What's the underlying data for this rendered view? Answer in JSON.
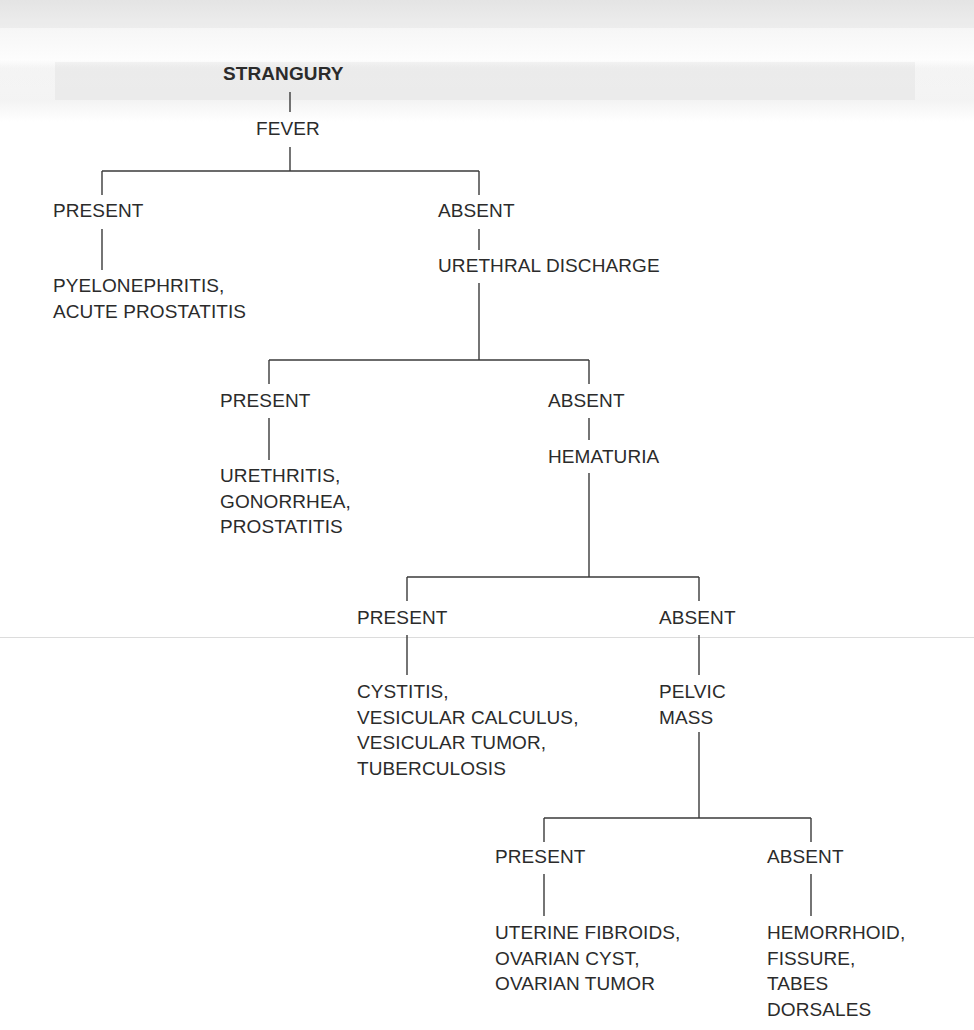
{
  "diagram": {
    "type": "decision-tree",
    "title": "STRANGURY",
    "root": {
      "label": "STRANGURY",
      "question": "FEVER",
      "branches": [
        {
          "label": "PRESENT",
          "result_lines": [
            "PYELONEPHRITIS,",
            "ACUTE PROSTATITIS"
          ]
        },
        {
          "label": "ABSENT",
          "question": "URETHRAL DISCHARGE",
          "branches": [
            {
              "label": "PRESENT",
              "result_lines": [
                "URETHRITIS,",
                "GONORRHEA,",
                "PROSTATITIS"
              ]
            },
            {
              "label": "ABSENT",
              "question": "HEMATURIA",
              "branches": [
                {
                  "label": "PRESENT",
                  "result_lines": [
                    "CYSTITIS,",
                    "VESICULAR CALCULUS,",
                    "VESICULAR TUMOR,",
                    "TUBERCULOSIS"
                  ]
                },
                {
                  "label": "ABSENT",
                  "question_lines": [
                    "PELVIC",
                    "MASS"
                  ],
                  "branches": [
                    {
                      "label": "PRESENT",
                      "result_lines": [
                        "UTERINE FIBROIDS,",
                        "OVARIAN CYST,",
                        "OVARIAN TUMOR"
                      ]
                    },
                    {
                      "label": "ABSENT",
                      "result_lines": [
                        "HEMORRHOID,",
                        "FISSURE,",
                        "TABES",
                        "DORSALES"
                      ]
                    }
                  ]
                }
              ]
            }
          ]
        }
      ]
    }
  },
  "colors": {
    "text": "#2b2b2b",
    "lines": "#3a3a3a",
    "background": "#ffffff"
  }
}
